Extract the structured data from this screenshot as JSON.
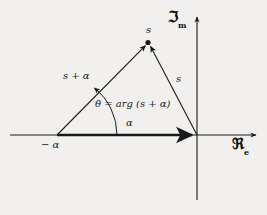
{
  "figure": {
    "kind": "complex-plane-phasor-triangle",
    "background_color": "#f1f0ee",
    "ink_color": "#1a1a1a"
  },
  "axes": {
    "imaginary": {
      "label_main": "ℑ",
      "label_sub": "m",
      "label_full": "ℑm",
      "orientation": "vertical",
      "arrow": "up"
    },
    "real": {
      "label_main": "ℜ",
      "label_sub": "e",
      "label_full": "ℜe",
      "orientation": "horizontal",
      "arrow": "right"
    }
  },
  "labels": {
    "apex_point": "s",
    "right_side": "s",
    "left_side": "s + α",
    "baseline": "α",
    "left_vertex": "− α",
    "angle_equation": "θ = arg (s + α)"
  },
  "geometry": {
    "origin": {
      "x": 197,
      "y": 135
    },
    "left_vertex": {
      "x": 57,
      "y": 135
    },
    "apex": {
      "x": 148,
      "y": 43
    },
    "real_axis": {
      "x1": 10,
      "y1": 135,
      "x2": 259,
      "y2": 135
    },
    "imaginary_axis": {
      "x1": 197,
      "y1": 14,
      "x2": 197,
      "y2": 200
    },
    "angle_arc_radius": 60
  }
}
